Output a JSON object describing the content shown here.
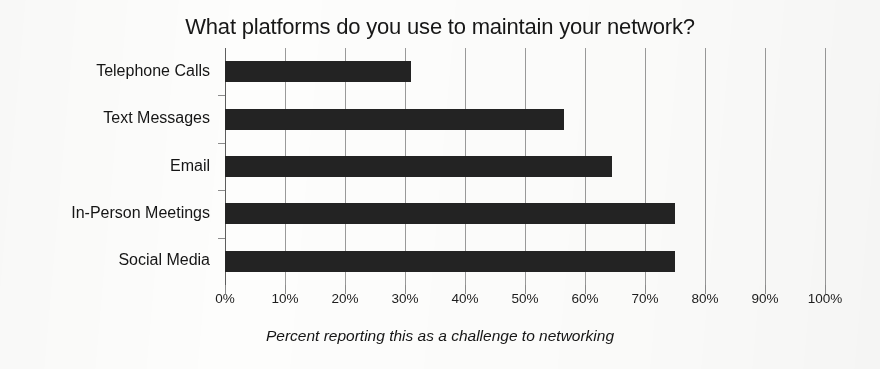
{
  "chart_data": {
    "type": "bar",
    "orientation": "horizontal",
    "title": "What platforms do you use to maintain your network?",
    "xlabel": "Percent reporting this as a challenge to networking",
    "ylabel": "",
    "categories": [
      "Telephone Calls",
      "Text Messages",
      "Email",
      "In-Person Meetings",
      "Social Media"
    ],
    "values": [
      31,
      56.5,
      64.5,
      75,
      75
    ],
    "xlim": [
      0,
      100
    ],
    "xticks": [
      0,
      10,
      20,
      30,
      40,
      50,
      60,
      70,
      80,
      90,
      100
    ],
    "xtick_labels": [
      "0%",
      "10%",
      "20%",
      "30%",
      "40%",
      "50%",
      "60%",
      "70%",
      "80%",
      "90%",
      "100%"
    ],
    "grid": "vertical",
    "legend": "none",
    "bar_color": "#232323",
    "gridline_color": "#9a9a9a",
    "background_color": "#fdfdfc"
  }
}
